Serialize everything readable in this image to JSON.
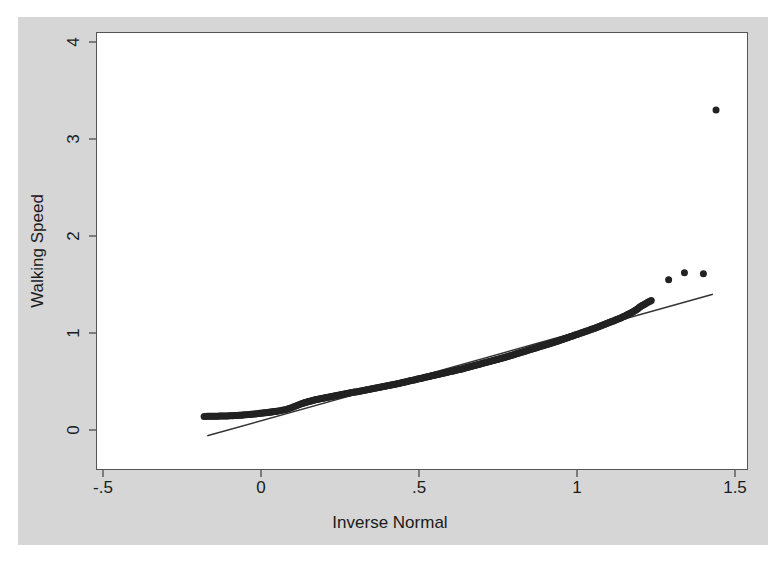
{
  "figure": {
    "width": 780,
    "height": 568,
    "background_color": "#ffffff",
    "graph_region_color": "#d6d6d6",
    "plot_panel_color": "#ffffff",
    "panel_border_color": "#555555"
  },
  "axes": {
    "x_title": "Inverse Normal",
    "y_title": "Walking Speed",
    "x_ticks": [
      "-.5",
      "0",
      ".5",
      "1",
      "1.5"
    ],
    "y_ticks": [
      "0",
      "1",
      "2",
      "3",
      "4"
    ]
  },
  "chart_data": {
    "type": "scatter",
    "title": "",
    "subtitle": "",
    "xlabel": "Inverse Normal",
    "ylabel": "Walking Speed",
    "xlim": [
      -0.66,
      1.6
    ],
    "ylim": [
      -0.12,
      4.38
    ],
    "xticks": [
      -0.5,
      0,
      0.5,
      1,
      1.5
    ],
    "xticklabels": [
      "-.5",
      "0",
      ".5",
      "1",
      "1.5"
    ],
    "yticks": [
      0,
      1,
      2,
      3,
      4
    ],
    "yticklabels": [
      "0",
      "1",
      "2",
      "3",
      "4"
    ],
    "grid": false,
    "legend": false,
    "marker_color": "#222222",
    "marker_size": 7,
    "reference_line_color": "#333333",
    "series": [
      {
        "name": "Walking Speed quantiles",
        "type": "scatter",
        "points": [
          [
            -0.18,
            0.14
          ],
          [
            -0.105,
            0.145
          ],
          [
            -0.075,
            0.15
          ],
          [
            -0.055,
            0.155
          ],
          [
            -0.04,
            0.16
          ],
          [
            -0.028,
            0.163
          ],
          [
            -0.018,
            0.166
          ],
          [
            -0.008,
            0.17
          ],
          [
            0.0,
            0.173
          ],
          [
            0.008,
            0.176
          ],
          [
            0.016,
            0.179
          ],
          [
            0.024,
            0.182
          ],
          [
            0.031,
            0.185
          ],
          [
            0.038,
            0.188
          ],
          [
            0.045,
            0.191
          ],
          [
            0.052,
            0.194
          ],
          [
            0.058,
            0.198
          ],
          [
            0.064,
            0.202
          ],
          [
            0.07,
            0.206
          ],
          [
            0.076,
            0.21
          ],
          [
            0.082,
            0.215
          ],
          [
            0.088,
            0.221
          ],
          [
            0.094,
            0.227
          ],
          [
            0.1,
            0.234
          ],
          [
            0.106,
            0.242
          ],
          [
            0.112,
            0.25
          ],
          [
            0.118,
            0.258
          ],
          [
            0.124,
            0.266
          ],
          [
            0.13,
            0.273
          ],
          [
            0.137,
            0.28
          ],
          [
            0.144,
            0.287
          ],
          [
            0.151,
            0.293
          ],
          [
            0.158,
            0.299
          ],
          [
            0.165,
            0.305
          ],
          [
            0.172,
            0.311
          ],
          [
            0.18,
            0.317
          ],
          [
            0.188,
            0.322
          ],
          [
            0.196,
            0.328
          ],
          [
            0.204,
            0.333
          ],
          [
            0.212,
            0.338
          ],
          [
            0.22,
            0.343
          ],
          [
            0.228,
            0.348
          ],
          [
            0.236,
            0.353
          ],
          [
            0.244,
            0.358
          ],
          [
            0.252,
            0.363
          ],
          [
            0.26,
            0.368
          ],
          [
            0.268,
            0.373
          ],
          [
            0.276,
            0.378
          ],
          [
            0.284,
            0.383
          ],
          [
            0.292,
            0.388
          ],
          [
            0.3,
            0.393
          ],
          [
            0.308,
            0.398
          ],
          [
            0.316,
            0.403
          ],
          [
            0.324,
            0.408
          ],
          [
            0.332,
            0.413
          ],
          [
            0.34,
            0.418
          ],
          [
            0.348,
            0.423
          ],
          [
            0.356,
            0.428
          ],
          [
            0.364,
            0.433
          ],
          [
            0.372,
            0.438
          ],
          [
            0.38,
            0.443
          ],
          [
            0.388,
            0.448
          ],
          [
            0.396,
            0.453
          ],
          [
            0.404,
            0.458
          ],
          [
            0.412,
            0.463
          ],
          [
            0.42,
            0.468
          ],
          [
            0.428,
            0.474
          ],
          [
            0.436,
            0.48
          ],
          [
            0.444,
            0.486
          ],
          [
            0.452,
            0.492
          ],
          [
            0.46,
            0.498
          ],
          [
            0.468,
            0.504
          ],
          [
            0.476,
            0.51
          ],
          [
            0.484,
            0.516
          ],
          [
            0.492,
            0.522
          ],
          [
            0.5,
            0.528
          ],
          [
            0.508,
            0.534
          ],
          [
            0.516,
            0.54
          ],
          [
            0.524,
            0.546
          ],
          [
            0.532,
            0.552
          ],
          [
            0.54,
            0.558
          ],
          [
            0.548,
            0.564
          ],
          [
            0.556,
            0.57
          ],
          [
            0.564,
            0.576
          ],
          [
            0.572,
            0.582
          ],
          [
            0.58,
            0.588
          ],
          [
            0.588,
            0.594
          ],
          [
            0.596,
            0.6
          ],
          [
            0.604,
            0.606
          ],
          [
            0.612,
            0.612
          ],
          [
            0.62,
            0.618
          ],
          [
            0.628,
            0.624
          ],
          [
            0.636,
            0.63
          ],
          [
            0.644,
            0.637
          ],
          [
            0.652,
            0.644
          ],
          [
            0.66,
            0.651
          ],
          [
            0.668,
            0.658
          ],
          [
            0.676,
            0.665
          ],
          [
            0.684,
            0.672
          ],
          [
            0.692,
            0.679
          ],
          [
            0.7,
            0.686
          ],
          [
            0.708,
            0.693
          ],
          [
            0.716,
            0.7
          ],
          [
            0.724,
            0.707
          ],
          [
            0.732,
            0.714
          ],
          [
            0.74,
            0.721
          ],
          [
            0.748,
            0.728
          ],
          [
            0.756,
            0.735
          ],
          [
            0.764,
            0.742
          ],
          [
            0.772,
            0.749
          ],
          [
            0.78,
            0.757
          ],
          [
            0.788,
            0.765
          ],
          [
            0.796,
            0.773
          ],
          [
            0.804,
            0.781
          ],
          [
            0.812,
            0.789
          ],
          [
            0.82,
            0.797
          ],
          [
            0.828,
            0.805
          ],
          [
            0.836,
            0.813
          ],
          [
            0.844,
            0.821
          ],
          [
            0.852,
            0.829
          ],
          [
            0.86,
            0.837
          ],
          [
            0.868,
            0.845
          ],
          [
            0.876,
            0.853
          ],
          [
            0.884,
            0.861
          ],
          [
            0.892,
            0.869
          ],
          [
            0.9,
            0.877
          ],
          [
            0.908,
            0.885
          ],
          [
            0.916,
            0.893
          ],
          [
            0.924,
            0.901
          ],
          [
            0.932,
            0.909
          ],
          [
            0.94,
            0.918
          ],
          [
            0.948,
            0.927
          ],
          [
            0.956,
            0.936
          ],
          [
            0.964,
            0.945
          ],
          [
            0.972,
            0.954
          ],
          [
            0.98,
            0.963
          ],
          [
            0.988,
            0.972
          ],
          [
            0.996,
            0.981
          ],
          [
            1.004,
            0.99
          ],
          [
            1.012,
            0.999
          ],
          [
            1.02,
            1.008
          ],
          [
            1.028,
            1.017
          ],
          [
            1.036,
            1.026
          ],
          [
            1.044,
            1.035
          ],
          [
            1.052,
            1.045
          ],
          [
            1.06,
            1.055
          ],
          [
            1.068,
            1.065
          ],
          [
            1.076,
            1.075
          ],
          [
            1.084,
            1.085
          ],
          [
            1.092,
            1.095
          ],
          [
            1.1,
            1.105
          ],
          [
            1.108,
            1.115
          ],
          [
            1.116,
            1.125
          ],
          [
            1.124,
            1.136
          ],
          [
            1.132,
            1.147
          ],
          [
            1.14,
            1.158
          ],
          [
            1.148,
            1.17
          ],
          [
            1.156,
            1.183
          ],
          [
            1.164,
            1.196
          ],
          [
            1.172,
            1.21
          ],
          [
            1.18,
            1.225
          ],
          [
            1.19,
            1.245
          ],
          [
            1.2,
            1.27
          ],
          [
            1.215,
            1.3
          ],
          [
            1.235,
            1.335
          ],
          [
            1.29,
            1.55
          ],
          [
            1.34,
            1.62
          ],
          [
            1.4,
            1.61
          ],
          [
            1.44,
            3.3
          ]
        ]
      }
    ],
    "reference_line": {
      "name": "reference line",
      "x": [
        -0.17,
        1.43
      ],
      "y": [
        -0.06,
        1.4
      ]
    },
    "outliers": [
      {
        "x": 1.44,
        "y": 3.3
      },
      {
        "x": 1.29,
        "y": 1.55
      },
      {
        "x": 1.34,
        "y": 1.62
      },
      {
        "x": 1.4,
        "y": 1.61
      }
    ],
    "n_points": 165
  }
}
